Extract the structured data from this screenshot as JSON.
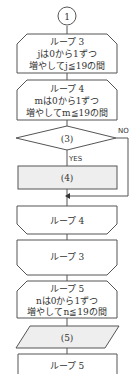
{
  "flowchart": {
    "connector": {
      "label": "1"
    },
    "loop3_start": {
      "lines": [
        "ループ 3",
        "jは0から1ずつ",
        "増やしてj≦19の間"
      ]
    },
    "loop4_start": {
      "lines": [
        "ループ 4",
        "mは0から1ずつ",
        "増やしてm≦19の間"
      ]
    },
    "decision": {
      "label": "(3)",
      "yes": "YES",
      "no": "NO"
    },
    "process4": {
      "label": "(4)"
    },
    "loop4_end": {
      "label": "ループ 4"
    },
    "loop3_end": {
      "label": "ループ 3"
    },
    "loop5_start": {
      "lines": [
        "ループ 5",
        "nは0から1ずつ",
        "増やしてn≦19の間"
      ]
    },
    "io5": {
      "label": "(5)"
    },
    "loop5_end": {
      "label": "ループ 5"
    }
  },
  "colors": {
    "stroke": "#555555",
    "shaded": "#eeeeee",
    "text": "#333333"
  }
}
